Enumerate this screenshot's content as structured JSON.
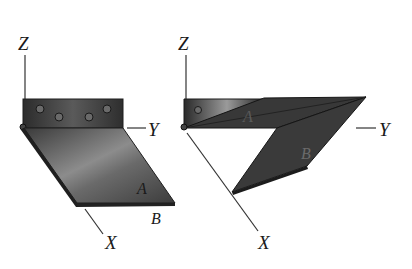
{
  "figure": {
    "left": {
      "axes": {
        "z": "Z",
        "y": "Y",
        "x": "X"
      },
      "plates": {
        "a": "A",
        "b": "B"
      }
    },
    "right": {
      "axes": {
        "z": "Z",
        "y": "Y",
        "x": "X"
      },
      "plates": {
        "a": "A",
        "b": "B"
      }
    },
    "colors": {
      "background": "#ffffff",
      "metal_dark": "#2a2a2a",
      "metal_mid": "#555555",
      "metal_light": "#9a9a9a",
      "line": "#333333"
    }
  }
}
